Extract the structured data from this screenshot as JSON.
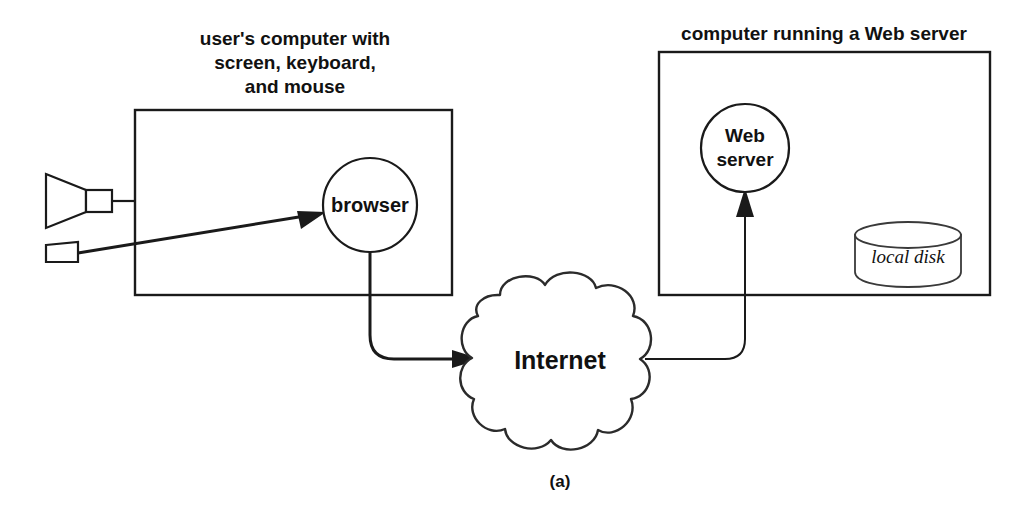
{
  "figure": {
    "caption": "(a)",
    "background_color": "#ffffff",
    "line_color": "#1a1a1a"
  },
  "client_side": {
    "title_line1": "user's computer with",
    "title_line2": "screen, keyboard,",
    "title_line3": "and mouse",
    "browser_node": {
      "label": "browser"
    },
    "devices": {
      "screen_icon_name": "monitor-icon",
      "mouse_icon_name": "mouse-icon"
    }
  },
  "network": {
    "cloud_label": "Internet"
  },
  "server_side": {
    "title": "computer running a Web server",
    "server_node": {
      "label_line1": "Web",
      "label_line2": "server"
    },
    "disk": {
      "label": "local disk"
    }
  }
}
